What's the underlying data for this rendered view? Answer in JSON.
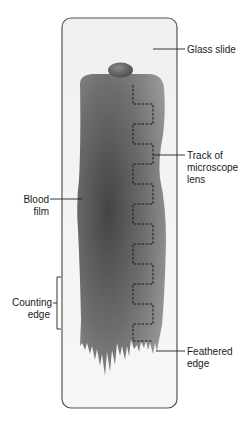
{
  "diagram": {
    "labels": {
      "glass_slide": "Glass slide",
      "track_line1": "Track of",
      "track_line2": "microscope",
      "track_line3": "lens",
      "blood_line1": "Blood",
      "blood_line2": "film",
      "counting_line1": "Counting",
      "counting_line2": "edge",
      "feathered_line1": "Feathered",
      "feathered_line2": "edge"
    },
    "colors": {
      "slide_fill": "#f4f4f4",
      "slide_stroke": "#555555",
      "film_dark": "#4a4a4a",
      "film_light": "#8e8e8e",
      "track": "#1a1a1a",
      "leader": "#222222"
    }
  }
}
